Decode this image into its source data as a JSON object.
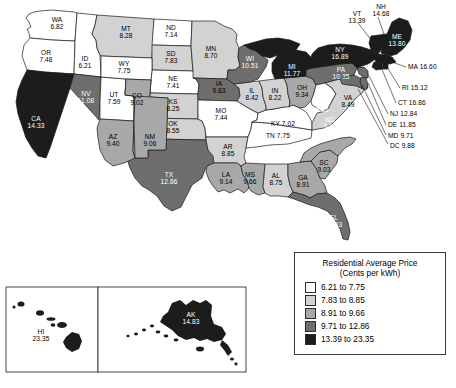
{
  "chart_data": {
    "type": "map",
    "title": "Residential Average Price (Cents per kWh)",
    "subtitle": "",
    "legend_position": "bottom-right",
    "units": "Cents per kWh",
    "classes": [
      {
        "label": "6.21 to 7.75",
        "color": "#ffffff",
        "min": 6.21,
        "max": 7.75
      },
      {
        "label": "7.83 to 8.85",
        "color": "#d2d2d2",
        "min": 7.83,
        "max": 8.85
      },
      {
        "label": "8.91 to 9.66",
        "color": "#a8a8a8",
        "min": 8.91,
        "max": 9.66
      },
      {
        "label": "9.71 to 12.86",
        "color": "#6e6e6e",
        "min": 9.71,
        "max": 12.86
      },
      {
        "label": "13.39 to 23.35",
        "color": "#1c1c1c",
        "min": 13.39,
        "max": 23.35
      }
    ],
    "states": [
      {
        "code": "WA",
        "value": 6.82,
        "class": 0
      },
      {
        "code": "OR",
        "value": 7.48,
        "class": 0
      },
      {
        "code": "ID",
        "value": 6.21,
        "class": 0
      },
      {
        "code": "MT",
        "value": 8.28,
        "class": 1
      },
      {
        "code": "ND",
        "value": 7.14,
        "class": 0
      },
      {
        "code": "MN",
        "value": 8.7,
        "class": 1
      },
      {
        "code": "WI",
        "value": 10.51,
        "class": 3
      },
      {
        "code": "MI",
        "value": 11.77,
        "class": 3
      },
      {
        "code": "NY",
        "value": 16.89,
        "class": 4
      },
      {
        "code": "VT",
        "value": 13.39,
        "class": 4
      },
      {
        "code": "NH",
        "value": 14.68,
        "class": 4
      },
      {
        "code": "ME",
        "value": 13.8,
        "class": 4
      },
      {
        "code": "MA",
        "value": 16.6,
        "class": 4
      },
      {
        "code": "RI",
        "value": 15.12,
        "class": 4
      },
      {
        "code": "CT",
        "value": 16.86,
        "class": 4
      },
      {
        "code": "NJ",
        "value": 12.84,
        "class": 3
      },
      {
        "code": "DE",
        "value": 11.85,
        "class": 3
      },
      {
        "code": "MD",
        "value": 9.71,
        "class": 3
      },
      {
        "code": "DC",
        "value": 9.88,
        "class": 3
      },
      {
        "code": "PA",
        "value": 10.35,
        "class": 3
      },
      {
        "code": "OH",
        "value": 9.34,
        "class": 2
      },
      {
        "code": "IN",
        "value": 8.22,
        "class": 1
      },
      {
        "code": "IL",
        "value": 8.42,
        "class": 1
      },
      {
        "code": "IA",
        "value": 9.83,
        "class": 3
      },
      {
        "code": "SD",
        "value": 7.83,
        "class": 1
      },
      {
        "code": "NE",
        "value": 7.41,
        "class": 0
      },
      {
        "code": "WY",
        "value": 7.75,
        "class": 0
      },
      {
        "code": "NV",
        "value": 11.08,
        "class": 3
      },
      {
        "code": "UT",
        "value": 7.59,
        "class": 0
      },
      {
        "code": "CO",
        "value": 9.02,
        "class": 2
      },
      {
        "code": "KS",
        "value": 8.25,
        "class": 1
      },
      {
        "code": "MO",
        "value": 7.44,
        "class": 0
      },
      {
        "code": "KY",
        "value": 7.02,
        "class": 0
      },
      {
        "code": "WV",
        "value": 6.35,
        "class": 0
      },
      {
        "code": "VA",
        "value": 8.49,
        "class": 1
      },
      {
        "code": "NC",
        "value": 9.12,
        "class": 2
      },
      {
        "code": "SC",
        "value": 9.03,
        "class": 2
      },
      {
        "code": "GA",
        "value": 8.91,
        "class": 2
      },
      {
        "code": "FL",
        "value": 11.53,
        "class": 3
      },
      {
        "code": "AL",
        "value": 8.75,
        "class": 1
      },
      {
        "code": "MS",
        "value": 9.66,
        "class": 2
      },
      {
        "code": "TN",
        "value": 7.75,
        "class": 0
      },
      {
        "code": "AR",
        "value": 8.85,
        "class": 1
      },
      {
        "code": "LA",
        "value": 9.14,
        "class": 2
      },
      {
        "code": "OK",
        "value": 8.55,
        "class": 1
      },
      {
        "code": "TX",
        "value": 12.86,
        "class": 3
      },
      {
        "code": "NM",
        "value": 9.06,
        "class": 2
      },
      {
        "code": "AZ",
        "value": 9.4,
        "class": 2
      },
      {
        "code": "CA",
        "value": 14.33,
        "class": 4
      },
      {
        "code": "AK",
        "value": 14.83,
        "class": 4
      },
      {
        "code": "HI",
        "value": 23.35,
        "class": 4
      }
    ]
  },
  "legend": {
    "title": "Residential Average Price",
    "subtitle": "(Cents per kWh)",
    "rows": [
      {
        "label": "6.21 to 7.75",
        "color": "#ffffff"
      },
      {
        "label": "7.83 to 8.85",
        "color": "#d2d2d2"
      },
      {
        "label": "8.91 to 9.66",
        "color": "#a8a8a8"
      },
      {
        "label": "9.71 to 12.86",
        "color": "#6e6e6e"
      },
      {
        "label": "13.39 to 23.35",
        "color": "#1c1c1c"
      }
    ]
  },
  "labels": {
    "WA": {
      "name": "WA",
      "value": "6.82"
    },
    "OR": {
      "name": "OR",
      "value": "7.48"
    },
    "ID": {
      "name": "ID",
      "value": "6.21"
    },
    "MT": {
      "name": "MT",
      "value": "8.28"
    },
    "ND": {
      "name": "ND",
      "value": "7.14"
    },
    "MN": {
      "name": "MN",
      "value": "8.70"
    },
    "WI": {
      "name": "WI",
      "value": "10.51"
    },
    "MI": {
      "name": "MI",
      "value": "11.77"
    },
    "NY": {
      "name": "NY",
      "value": "16.89"
    },
    "VT": {
      "name": "VT",
      "value": "13.39"
    },
    "NH": {
      "name": "NH",
      "value": "14.68"
    },
    "ME": {
      "name": "ME",
      "value": "13.80"
    },
    "MA": {
      "name": "MA 16.60"
    },
    "RI": {
      "name": "RI 15.12"
    },
    "CT": {
      "name": "CT 16.86"
    },
    "NJ": {
      "name": "NJ 12.84"
    },
    "DE": {
      "name": "DE 11.85"
    },
    "MD": {
      "name": "MD 9.71"
    },
    "DC": {
      "name": "DC 9.88"
    },
    "PA": {
      "name": "PA",
      "value": "10.35"
    },
    "OH": {
      "name": "OH",
      "value": "9.34"
    },
    "IN": {
      "name": "IN",
      "value": "8.22"
    },
    "IL": {
      "name": "IL",
      "value": "8.42"
    },
    "IA": {
      "name": "IA",
      "value": "9.83"
    },
    "SD": {
      "name": "SD",
      "value": "7.83"
    },
    "NE": {
      "name": "NE",
      "value": "7.41"
    },
    "WY": {
      "name": "WY",
      "value": "7.75"
    },
    "NV": {
      "name": "NV",
      "value": "11.08"
    },
    "UT": {
      "name": "UT",
      "value": "7.59"
    },
    "CO": {
      "name": "CO",
      "value": "9.02"
    },
    "KS": {
      "name": "KS",
      "value": "8.25"
    },
    "MO": {
      "name": "MO",
      "value": "7.44"
    },
    "KY": {
      "name": "KY 7.02"
    },
    "WV": {
      "name": "WV",
      "value": "6.35"
    },
    "VA": {
      "name": "VA",
      "value": "8.49"
    },
    "NC": {
      "name": "NC",
      "value": "9.12"
    },
    "SC": {
      "name": "SC",
      "value": "9.03"
    },
    "GA": {
      "name": "GA",
      "value": "8.91"
    },
    "FL": {
      "name": "FL",
      "value": "11.53"
    },
    "AL": {
      "name": "AL",
      "value": "8.75"
    },
    "MS": {
      "name": "MS",
      "value": "9.66"
    },
    "TN": {
      "name": "TN 7.75"
    },
    "AR": {
      "name": "AR",
      "value": "8.85"
    },
    "LA": {
      "name": "LA",
      "value": "9.14"
    },
    "OK": {
      "name": "OK",
      "value": "8.55"
    },
    "TX": {
      "name": "TX",
      "value": "12.86"
    },
    "NM": {
      "name": "NM",
      "value": "9.06"
    },
    "AZ": {
      "name": "AZ",
      "value": "9.40"
    },
    "CA": {
      "name": "CA",
      "value": "14.33"
    },
    "AK": {
      "name": "AK",
      "value": "14.83"
    },
    "HI": {
      "name": "HI",
      "value": "23.35"
    }
  },
  "footer": {
    "text": ""
  }
}
